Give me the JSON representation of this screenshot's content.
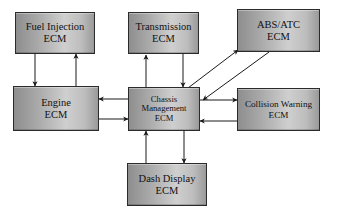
{
  "diagram": {
    "background_color": "#ffffff",
    "node_border_color": "#2b2b2b",
    "edge_color": "#1a1a1a",
    "nodes": [
      {
        "id": "fuel-injection",
        "label": "Fuel Injection\nECM"
      },
      {
        "id": "transmission",
        "label": "Transmission\nECM"
      },
      {
        "id": "abs-atc",
        "label": "ABS/ATC\nECM"
      },
      {
        "id": "engine",
        "label": "Engine\nECM"
      },
      {
        "id": "chassis-management",
        "label": "Chassis\nManagement\nECM"
      },
      {
        "id": "collision-warning",
        "label": "Collision Warning\nECM"
      },
      {
        "id": "dash-display",
        "label": "Dash Display\nECM"
      }
    ],
    "edges": [
      {
        "from": "fuel-injection",
        "to": "engine",
        "direction": "down",
        "style": "solid"
      },
      {
        "from": "engine",
        "to": "fuel-injection",
        "direction": "up",
        "style": "solid"
      },
      {
        "from": "chassis-management",
        "to": "transmission",
        "direction": "up",
        "style": "solid"
      },
      {
        "from": "transmission",
        "to": "chassis-management",
        "direction": "down",
        "style": "solid"
      },
      {
        "from": "chassis-management",
        "to": "engine",
        "direction": "left",
        "style": "solid"
      },
      {
        "from": "engine",
        "to": "chassis-management",
        "direction": "right",
        "style": "solid"
      },
      {
        "from": "chassis-management",
        "to": "abs-atc",
        "direction": "up-right",
        "style": "solid"
      },
      {
        "from": "abs-atc",
        "to": "chassis-management",
        "direction": "down-left",
        "style": "solid"
      },
      {
        "from": "chassis-management",
        "to": "collision-warning",
        "direction": "right",
        "style": "solid"
      },
      {
        "from": "collision-warning",
        "to": "chassis-management",
        "direction": "left",
        "style": "solid"
      },
      {
        "from": "chassis-management",
        "to": "dash-display",
        "direction": "down",
        "style": "solid"
      },
      {
        "from": "dash-display",
        "to": "chassis-management",
        "direction": "up",
        "style": "solid"
      }
    ]
  }
}
